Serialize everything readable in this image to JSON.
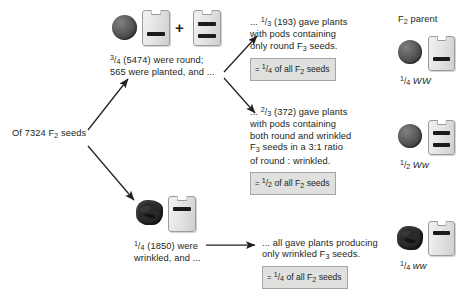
{
  "diagram": {
    "title_hidden": "Mendel F2 to F3 seed ratio pedigree",
    "start_label": "Of 7324 F2 seeds",
    "start_label_parts": {
      "pre": "Of 7324 F",
      "sub": "2",
      "post": " seeds"
    },
    "header_right": "F2 parent",
    "header_right_parts": {
      "pre": "F",
      "sub": "2",
      "post": " parent"
    },
    "branches": {
      "round": {
        "fraction_num": "3",
        "fraction_den": "4",
        "count": "(5474)",
        "line1": "were round;",
        "line2": "565 were planted, and ..."
      },
      "wrinkled": {
        "fraction_num": "1",
        "fraction_den": "4",
        "count": "(1850)",
        "line1": "were",
        "line2": "wrinkled, and ..."
      }
    },
    "outcomes": [
      {
        "id": "outcome-round-only",
        "lead": "...",
        "fraction_num": "1",
        "fraction_den": "3",
        "count": "(193)",
        "text_line1": "gave plants",
        "text_line2": "with pods containing",
        "text_line3": "only round F3 seeds.",
        "text_line3_pre": "only round F",
        "text_line3_sub": "3",
        "text_line3_post": " seeds.",
        "box": {
          "eq": "=",
          "num": "1",
          "den": "4",
          "rest": "of all F2 seeds",
          "rest_pre": "of all F",
          "rest_sub": "2",
          "rest_post": " seeds"
        }
      },
      {
        "id": "outcome-mixed",
        "lead": "...",
        "fraction_num": "2",
        "fraction_den": "3",
        "count": "(372)",
        "text_line1": "gave plants",
        "text_line2": "with pods containing",
        "text_line3": "both round and wrinkled",
        "text_line4": "F3 seeds in a 3:1 ratio",
        "text_line4_pre": "F",
        "text_line4_sub": "3",
        "text_line4_post": " seeds in a 3:1 ratio",
        "text_line5": "of round : wrinkled.",
        "box": {
          "eq": "=",
          "num": "1",
          "den": "2",
          "rest_pre": "of all F",
          "rest_sub": "2",
          "rest_post": " seeds"
        }
      },
      {
        "id": "outcome-wrinkled-only",
        "text_line1": "... all gave plants producing",
        "text_line2_pre": "only wrinkled F",
        "text_line2_sub": "3",
        "text_line2_post": " seeds.",
        "box": {
          "eq": "=",
          "num": "1",
          "den": "4",
          "rest_pre": "of all F",
          "rest_sub": "2",
          "rest_post": " seeds"
        }
      }
    ],
    "parents": [
      {
        "id": "parent-WW",
        "num": "1",
        "den": "4",
        "genotype": "WW",
        "pod_bars": 1,
        "seed": "round"
      },
      {
        "id": "parent-Ww",
        "num": "1",
        "den": "2",
        "genotype": "Ww",
        "pod_bars": 2,
        "seed": "round"
      },
      {
        "id": "parent-ww",
        "num": "1",
        "den": "4",
        "genotype": "ww",
        "pod_bars": 1,
        "seed": "wrinkled"
      }
    ],
    "symbols": {
      "plus": "+"
    },
    "colors": {
      "text": "#231f20",
      "box_fill": "#e0e0de",
      "box_border": "#a5a5a3",
      "pod_fill": "#e3e3e1",
      "pod_border": "#9b9b99",
      "seed_round": "#4a4c4d",
      "seed_wrinkled": "#2c2a28",
      "arrow": "#231f20",
      "background": "#ffffff"
    }
  }
}
